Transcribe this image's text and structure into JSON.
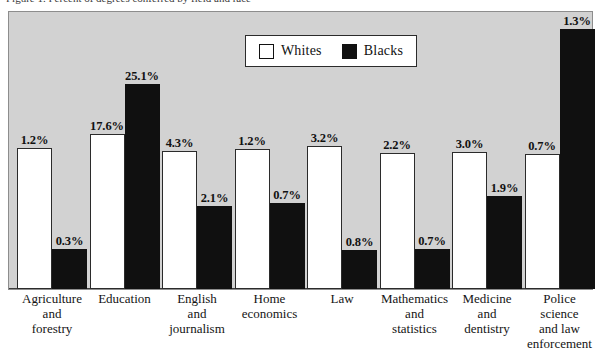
{
  "caption": {
    "text": "Figure 1. Percent of degrees conferred by field and race"
  },
  "legend": {
    "entries": [
      {
        "label": "Whites",
        "swatch": "white",
        "color": "#ffffff"
      },
      {
        "label": "Blacks",
        "swatch": "black",
        "color": "#101010"
      }
    ]
  },
  "chart_data": {
    "type": "bar",
    "title": "",
    "xlabel": "",
    "ylabel": "",
    "ylim": [
      0,
      27.5
    ],
    "grid": false,
    "legend_position": "top-center",
    "value_suffix": "%",
    "categories": [
      "Agriculture and forestry",
      "Education",
      "English and journalism",
      "Home economics",
      "Law",
      "Mathematics and statistics",
      "Medicine and dentistry",
      "Police science and law enforcement"
    ],
    "category_lines": [
      [
        "Agriculture",
        "and",
        "forestry"
      ],
      [
        "Education"
      ],
      [
        "English",
        "and",
        "journalism"
      ],
      [
        "Home",
        "economics"
      ],
      [
        "Law"
      ],
      [
        "Mathematics",
        "and",
        "statistics"
      ],
      [
        "Medicine",
        "and",
        "dentistry"
      ],
      [
        "Police",
        "science",
        "and law",
        "enforcement"
      ]
    ],
    "series": [
      {
        "name": "Whites",
        "color": "#ffffff",
        "values": [
          1.2,
          17.6,
          4.3,
          1.2,
          3.2,
          2.2,
          3.0,
          0.7
        ],
        "labels": [
          "1.2%",
          "17.6%",
          "4.3%",
          "1.2%",
          "3.2%",
          "2.2%",
          "3.0%",
          "0.7%"
        ]
      },
      {
        "name": "Blacks",
        "color": "#101010",
        "values": [
          0.3,
          25.1,
          2.1,
          0.7,
          0.8,
          0.7,
          1.9,
          1.3
        ],
        "labels": [
          "0.3%",
          "25.1%",
          "2.1%",
          "0.7%",
          "0.8%",
          "0.7%",
          "1.9%",
          "1.3%"
        ]
      }
    ],
    "bar_pixel_heights": {
      "Whites": [
        141,
        155,
        138,
        140,
        143,
        136,
        137,
        135
      ],
      "Blacks": [
        40,
        205,
        83,
        86,
        39,
        40,
        93,
        260
      ]
    }
  }
}
